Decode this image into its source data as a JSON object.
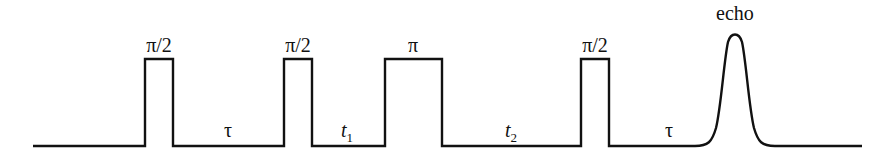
{
  "diagram": {
    "colors": {
      "line": "#111111",
      "background": "#ffffff"
    },
    "pulses": [
      {
        "label": "π/2",
        "x_start": 145,
        "x_end": 173
      },
      {
        "label": "π/2",
        "x_start": 284,
        "x_end": 312
      },
      {
        "label": "π",
        "x_start": 385,
        "x_end": 442
      },
      {
        "label": "π/2",
        "x_start": 581,
        "x_end": 609
      }
    ],
    "intervals": [
      {
        "label": "τ",
        "base": "τ",
        "sub": ""
      },
      {
        "label": "t1",
        "base": "t",
        "sub": "1"
      },
      {
        "label": "t2",
        "base": "t",
        "sub": "2"
      },
      {
        "label": "τ",
        "base": "τ",
        "sub": ""
      }
    ],
    "echo": {
      "label": "echo",
      "center_x": 735
    }
  }
}
